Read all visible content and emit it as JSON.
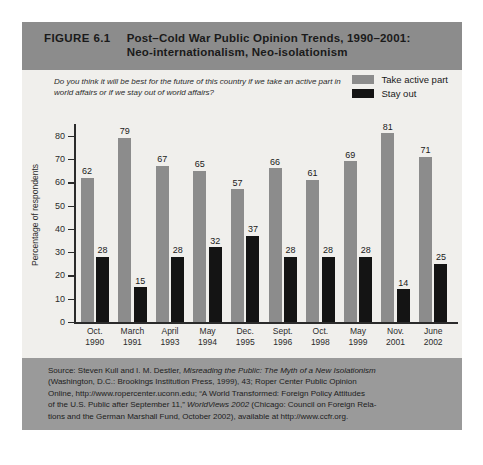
{
  "figure": {
    "number": "FIGURE 6.1",
    "title_line1": "Post–Cold War Public Opinion Trends, 1990–2001:",
    "title_line2": "Neo-internationalism, Neo-isolationism"
  },
  "question": "Do you think it will be best for the future of this country if we take an active part in world affairs or if we stay out of world affairs?",
  "legend": {
    "series1_label": "Take active part",
    "series2_label": "Stay out",
    "series1_color": "#8c8c8c",
    "series2_color": "#141414"
  },
  "source": {
    "line1": "Source: Steven Kull and I. M. Destler, Misreading the Public: The Myth of a New Isolationism",
    "line2": "(Washington, D.C.: Brookings Institution Press, 1999), 43; Roper Center Public Opinion",
    "line3": "Online, http://www.ropercenter.uconn.edu; “A World Transformed: Foreign Policy Attitudes",
    "line4": "of the U.S. Public after September 11,” WorldViews 2002 (Chicago: Council on Foreign Rela-",
    "line5": "tions and the German Marshall Fund, October 2002), available at http://www.ccfr.org."
  },
  "chart_data": {
    "type": "bar",
    "title": "Post–Cold War Public Opinion Trends, 1990–2001: Neo-internationalism, Neo-isolationism",
    "xlabel": "",
    "ylabel": "Percentage of respondents",
    "ylim": [
      0,
      85
    ],
    "yticks": [
      0,
      10,
      20,
      30,
      40,
      50,
      60,
      70,
      80
    ],
    "grid": false,
    "legend_position": "top-right",
    "categories": [
      "Oct. 1990",
      "March 1991",
      "April 1993",
      "May 1994",
      "Dec. 1995",
      "Sept. 1996",
      "Oct. 1998",
      "May 1999",
      "Nov. 2001",
      "June 2002"
    ],
    "category_lines": [
      [
        "Oct.",
        "1990"
      ],
      [
        "March",
        "1991"
      ],
      [
        "April",
        "1993"
      ],
      [
        "May",
        "1994"
      ],
      [
        "Dec.",
        "1995"
      ],
      [
        "Sept.",
        "1996"
      ],
      [
        "Oct.",
        "1998"
      ],
      [
        "May",
        "1999"
      ],
      [
        "Nov.",
        "2001"
      ],
      [
        "June",
        "2002"
      ]
    ],
    "series": [
      {
        "name": "Take active part",
        "color": "#8c8c8c",
        "values": [
          62,
          79,
          67,
          65,
          57,
          66,
          61,
          69,
          81,
          71
        ]
      },
      {
        "name": "Stay out",
        "color": "#141414",
        "values": [
          28,
          15,
          28,
          32,
          37,
          28,
          28,
          28,
          14,
          25
        ]
      }
    ]
  }
}
